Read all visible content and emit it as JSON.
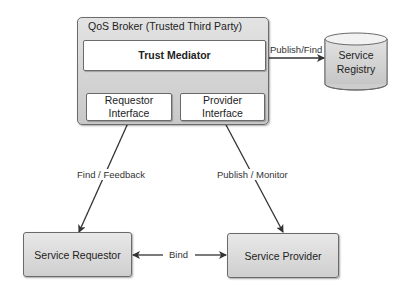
{
  "diagram": {
    "broker": {
      "title": "QoS Broker (Trusted Third Party)",
      "trust_mediator": "Trust Mediator",
      "requestor_interface": {
        "line1": "Requestor",
        "line2": "Interface"
      },
      "provider_interface": {
        "line1": "Provider",
        "line2": "Interface"
      }
    },
    "registry": {
      "line1": "Service",
      "line2": "Registry"
    },
    "service_requestor": "Service Requestor",
    "service_provider": "Service Provider",
    "edges": {
      "publish_find": "Publish/Find",
      "find_feedback": "Find / Feedback",
      "publish_monitor": "Publish / Monitor",
      "bind": "Bind"
    },
    "colors": {
      "box_fill_top": "#e3e3e3",
      "box_fill_bottom": "#c8c8c8",
      "border": "#6a6a6a",
      "arrow": "#333333"
    }
  }
}
